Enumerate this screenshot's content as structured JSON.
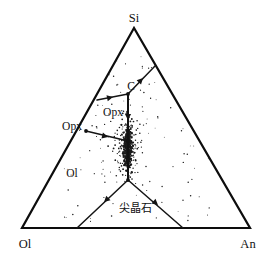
{
  "figure": {
    "type": "ternary-phase-diagram",
    "title": "",
    "background_color": "#ffffff",
    "line_color": "#111111",
    "point_color": "#1a1a1a"
  },
  "vertices": [
    {
      "id": "si",
      "label": "Si",
      "position": "top",
      "x": 134,
      "y": 28
    },
    {
      "id": "ol",
      "label": "Ol",
      "position": "bottom-left",
      "x": 22,
      "y": 228
    },
    {
      "id": "an",
      "label": "An",
      "position": "bottom-right",
      "x": 250,
      "y": 228
    }
  ],
  "vertex_labels": [
    {
      "text": "Si",
      "x": 134,
      "y": 22
    },
    {
      "text": "Ol",
      "x": 25,
      "y": 248
    },
    {
      "text": "An",
      "x": 248,
      "y": 248
    }
  ],
  "field_labels": [
    {
      "text": "C",
      "x": 131,
      "y": 90,
      "name": "label-c"
    },
    {
      "text": "Opx",
      "x": 113,
      "y": 116,
      "name": "label-opx-interior"
    },
    {
      "text": "Opx",
      "x": 72,
      "y": 130,
      "name": "label-opx-edge"
    },
    {
      "text": "Ol",
      "x": 72,
      "y": 177,
      "name": "label-ol-interior"
    },
    {
      "text": "尖晶石",
      "x": 135,
      "y": 212,
      "name": "label-spinel"
    }
  ],
  "boundaries": [
    {
      "name": "c-to-right-edge",
      "path": "M 128 94 L 155 66"
    },
    {
      "name": "c-to-left-edge",
      "path": "M 128 94 L 97 100"
    },
    {
      "name": "c-vertical-down",
      "path": "M 128 94 L 128 141"
    },
    {
      "name": "opx-edge-to-node",
      "path": "M 86 131 L 128 141"
    },
    {
      "name": "node-to-junction",
      "path": "M 128 141 L 128 180"
    },
    {
      "name": "junction-left",
      "path": "M 128 180 L 77 228"
    },
    {
      "name": "junction-right",
      "path": "M 128 180 L 183 228"
    }
  ],
  "arrows": [
    {
      "name": "arrow-toward-c-horizontal",
      "x": 113,
      "y": 97,
      "angle": -12
    },
    {
      "name": "arrow-down-vertical-upper",
      "x": 128,
      "y": 120,
      "angle": 90
    },
    {
      "name": "arrow-toward-node",
      "x": 108,
      "y": 137,
      "angle": 14
    },
    {
      "name": "arrow-down-vertical-lower",
      "x": 128,
      "y": 164,
      "angle": 90
    },
    {
      "name": "arrow-junction-left",
      "x": 104,
      "y": 202,
      "angle": 137
    },
    {
      "name": "arrow-junction-right",
      "x": 158,
      "y": 205,
      "angle": 41
    },
    {
      "name": "arrow-c-to-right-edge",
      "x": 143,
      "y": 78,
      "angle": -46
    }
  ],
  "nodes": [
    {
      "name": "node-c",
      "x": 128,
      "y": 94
    },
    {
      "name": "node-opx-edge",
      "x": 86,
      "y": 131
    },
    {
      "name": "node-opx-ol",
      "x": 128,
      "y": 141
    },
    {
      "name": "node-triple",
      "x": 128,
      "y": 180
    }
  ],
  "chart_data": {
    "type": "scatter",
    "title": "",
    "xlabel": "",
    "ylabel": "",
    "axes": [
      "Si",
      "Ol",
      "An"
    ],
    "point_count": 620,
    "cluster": {
      "center_x": 128,
      "center_y": 148,
      "spread_x": 6,
      "spread_y": 30
    },
    "scatter_region": {
      "x_min": 60,
      "x_max": 215,
      "y_min": 55,
      "y_max": 222
    },
    "legend": "none",
    "grid": false
  }
}
